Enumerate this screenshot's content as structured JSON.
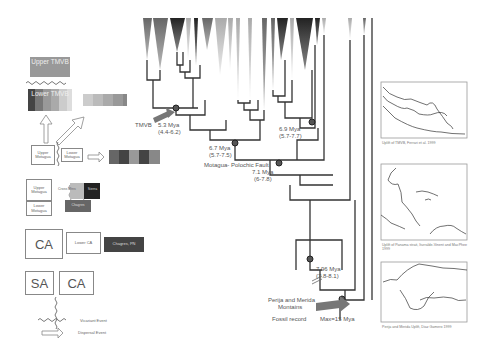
{
  "legend_left": {
    "upper_tmvb": "Upper TMVB",
    "lower_tmvb": "Lower TMVB",
    "upper_motagua": "Upper Motagua",
    "lower_motagua": "Lower Motagua",
    "upper_motagua_2": "Upper Motagua",
    "lower_motagua_2": "Lower Motagua",
    "cross_mtns": "Cross Mtns",
    "sierra": "Sierra",
    "chagres_small": "Chagres",
    "ca": "CA",
    "lower_ca": "Lower CA",
    "chagres_pn": "Chagres, PN",
    "sa": "SA",
    "ca2": "CA",
    "vicariant_event": "Vicariant Event",
    "dispersal_event": "Dispersal Event"
  },
  "tree_labels": {
    "tmvb": "TMVB",
    "node1_age": "5.3 Mya",
    "node1_ci": "(4.4-6.2)",
    "node2_age": "6.7 Mya",
    "node2_ci": "(5.7-7.5)",
    "node3_age": "6.9 Mya",
    "node3_ci": "(5.7-7.7)",
    "node4_title": "Motagua- Polochic Fault",
    "node4_age": "7.1 Mya",
    "node4_ci": "(6-7.8)",
    "node5_age": "7.96 Mya",
    "node5_ci": "(7.8-8.1)",
    "perija": "Perija and Merida",
    "perija2": "Montains",
    "fossil": "Fossil record",
    "max": "Max=15 Mya"
  },
  "maps": [
    {
      "caption": "Uplift of TMVB, Ferrari et al. 1999"
    },
    {
      "caption": "Uplift of Panama strait, Iturralde-Vinent and MacPhee 1999"
    },
    {
      "caption": "Perija and Merida Uplift, Diaz Gamero 1999"
    }
  ],
  "colors": {
    "node": "#555555",
    "arrow": "#777777",
    "line": "#333333"
  }
}
